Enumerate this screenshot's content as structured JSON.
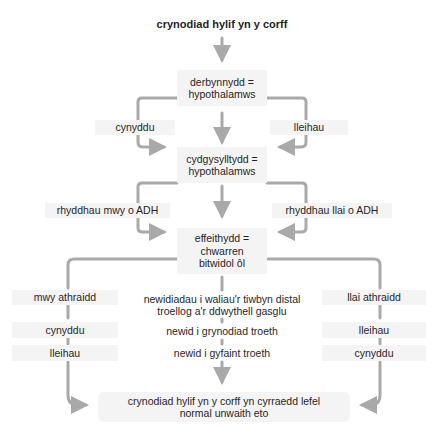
{
  "title": "crynodiad hylif yn y corff",
  "receptor": "derbynnydd =\nhypothalamws",
  "level1": {
    "left": "cynyddu",
    "right": "lleihau"
  },
  "coordinator": "cydgysylltydd =\nhypothalamws",
  "level2": {
    "left": "rhyddhau mwy o ADH",
    "right": "rhyddhau llai o ADH"
  },
  "effector": "effeithydd =\nchwarren\nbitwidol ôl",
  "center_steps": [
    "newidiadau i waliau'r tiwbyn distal\ntroellog a'r ddwythell gasglu",
    "newid i grynodiad troeth",
    "newid i gyfaint troeth"
  ],
  "left_steps": [
    "mwy athraidd",
    "cynyddu",
    "lleihau"
  ],
  "right_steps": [
    "llai athraidd",
    "lleihau",
    "cynyddu"
  ],
  "result": "crynodiad hylif yn y corff yn cyrraedd lefel\nnormal unwaith eto",
  "colors": {
    "arrow": "#a9a9a9",
    "box": "#f4f4f4",
    "text": "#1f1f1f"
  }
}
